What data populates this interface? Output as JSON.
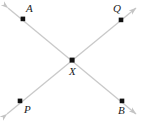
{
  "figure": {
    "type": "geometry-diagram",
    "width": 143,
    "height": 121,
    "background_color": "#ffffff",
    "line_color": "#c9c9c9",
    "point_color": "#111111",
    "label_color": "#1c1c1c",
    "points": [
      {
        "id": "A",
        "label": "A",
        "x": 23,
        "y": 19,
        "label_x": 26,
        "label_y": 3
      },
      {
        "id": "Q",
        "label": "Q",
        "x": 121,
        "y": 20,
        "label_x": 113,
        "label_y": 3
      },
      {
        "id": "X",
        "label": "X",
        "x": 72,
        "y": 60,
        "label_x": 69,
        "label_y": 66
      },
      {
        "id": "P",
        "label": "P",
        "x": 20,
        "y": 101,
        "label_x": 24,
        "label_y": 104
      },
      {
        "id": "B",
        "label": "B",
        "x": 122,
        "y": 101,
        "label_x": 118,
        "label_y": 105
      }
    ],
    "lines": [
      {
        "id": "line-AB",
        "name": "line-a-b",
        "through": [
          "A",
          "X",
          "B"
        ],
        "x1": 8,
        "y1": 8,
        "x2": 136,
        "y2": 114,
        "arrow_start": true,
        "arrow_end": true
      },
      {
        "id": "line-PQ",
        "name": "line-p-q",
        "through": [
          "P",
          "X",
          "Q"
        ],
        "x1": 7,
        "y1": 114,
        "x2": 136,
        "y2": 8,
        "arrow_start": true,
        "arrow_end": true
      }
    ],
    "arrowheads": [
      {
        "id": "arrow-upper-left",
        "x": 8,
        "y": 8,
        "direction": "up-left"
      },
      {
        "id": "arrow-lower-right",
        "x": 136,
        "y": 114,
        "direction": "down-right"
      },
      {
        "id": "arrow-lower-left",
        "x": 7,
        "y": 114,
        "direction": "down-left"
      },
      {
        "id": "arrow-upper-right",
        "x": 136,
        "y": 8,
        "direction": "up-right"
      }
    ]
  }
}
